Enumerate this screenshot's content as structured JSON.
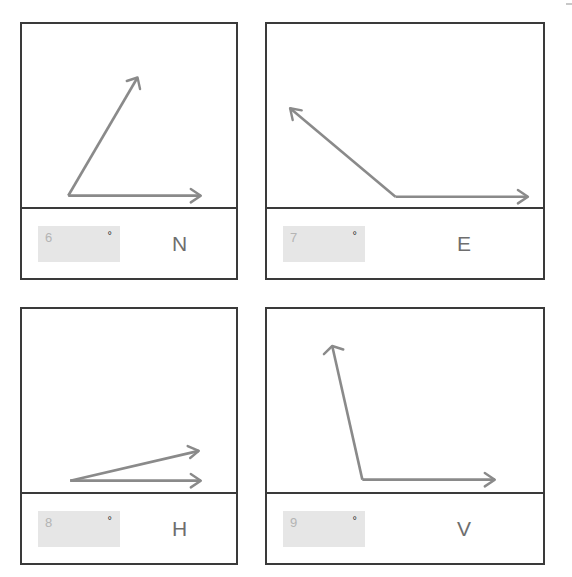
{
  "page": {
    "background_color": "#ffffff",
    "panel_border_color": "#3a3a3a",
    "ray_color": "#8a8a8a",
    "input_fill_color": "#e6e6e6",
    "input_text_color": "#b4b4b4",
    "letter_color": "#6e6e6e",
    "degree_symbol": "°"
  },
  "panels": [
    {
      "letter": "N",
      "input_value": "6",
      "degree_symbol": "°",
      "angle_description": "acute angle opening up-right from vertex",
      "angle_degrees": 41,
      "vertex": [
        46,
        167
      ],
      "ray_horizontal_tip": [
        178,
        167
      ],
      "ray_other_tip": [
        115,
        52
      ]
    },
    {
      "letter": "E",
      "input_value": "7",
      "degree_symbol": "°",
      "angle_description": "obtuse angle opening up-left from vertex",
      "angle_degrees": 147,
      "vertex": [
        128,
        168
      ],
      "ray_horizontal_tip": [
        260,
        168
      ],
      "ray_other_tip": [
        23,
        82
      ]
    },
    {
      "letter": "H",
      "input_value": "8",
      "degree_symbol": "°",
      "angle_description": "narrow acute angle opening slightly up-right from vertex",
      "angle_degrees": 13,
      "vertex": [
        48,
        167
      ],
      "ray_horizontal_tip": [
        178,
        167
      ],
      "ray_other_tip": [
        176,
        138
      ]
    },
    {
      "letter": "V",
      "input_value": "9",
      "degree_symbol": "°",
      "angle_description": "obtuse angle opening steeply up-left from vertex",
      "angle_degrees": 103,
      "vertex": [
        95,
        166
      ],
      "ray_horizontal_tip": [
        227,
        166
      ],
      "ray_other_tip": [
        65,
        36
      ]
    }
  ]
}
